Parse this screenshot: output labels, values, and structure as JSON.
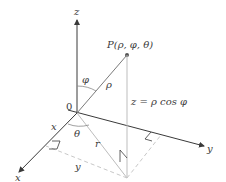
{
  "diagram": {
    "labels": {
      "z_axis": "z",
      "x_axis": "x",
      "y_axis": "y",
      "origin": "0",
      "point": "P(ρ, φ, θ)",
      "phi": "φ",
      "rho": "ρ",
      "theta": "θ",
      "r": "r",
      "x_component": "x",
      "y_component": "y",
      "z_relation": "z = ρ cos φ"
    },
    "colors": {
      "axis": "#3a3a3a",
      "guide": "#bdbdbd",
      "dashed": "#c8c8c8",
      "point": "#555555"
    }
  }
}
